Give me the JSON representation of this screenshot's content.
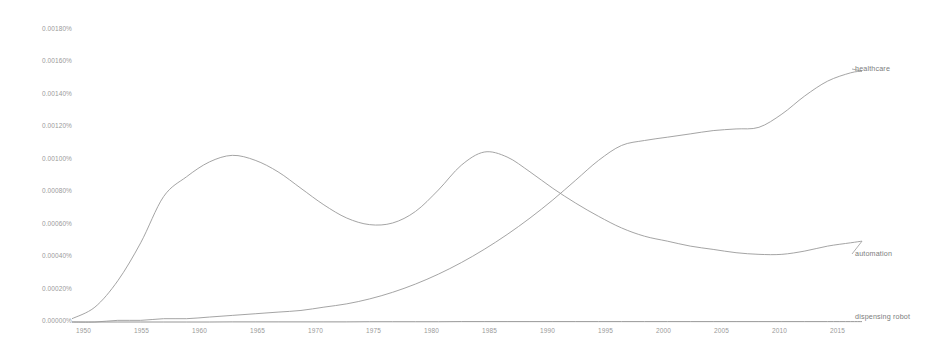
{
  "chart_data": {
    "type": "line",
    "title": "",
    "subtitle": "",
    "xlabel": "",
    "ylabel": "",
    "xlim": [
      1950,
      2019
    ],
    "ylim": [
      0.0,
      0.0018
    ],
    "grid": false,
    "legend_position": "right-inline-labels",
    "y_unit": "percent",
    "y_ticks": [
      {
        "value": 0.0018,
        "label": "0.00180%"
      },
      {
        "value": 0.0016,
        "label": "0.00160%"
      },
      {
        "value": 0.0014,
        "label": "0.00140%"
      },
      {
        "value": 0.0012,
        "label": "0.00120%"
      },
      {
        "value": 0.001,
        "label": "0.00100%"
      },
      {
        "value": 0.0008,
        "label": "0.00080%"
      },
      {
        "value": 0.0006,
        "label": "0.00060%"
      },
      {
        "value": 0.0004,
        "label": "0.00040%"
      },
      {
        "value": 0.0002,
        "label": "0.00020%"
      },
      {
        "value": 0.0,
        "label": "0.00000%"
      }
    ],
    "x_ticks": [
      {
        "value": 1950,
        "label": "1950"
      },
      {
        "value": 1955,
        "label": "1955"
      },
      {
        "value": 1960,
        "label": "1960"
      },
      {
        "value": 1965,
        "label": "1965"
      },
      {
        "value": 1970,
        "label": "1970"
      },
      {
        "value": 1975,
        "label": "1975"
      },
      {
        "value": 1980,
        "label": "1980"
      },
      {
        "value": 1985,
        "label": "1985"
      },
      {
        "value": 1990,
        "label": "1990"
      },
      {
        "value": 1995,
        "label": "1995"
      },
      {
        "value": 2000,
        "label": "2000"
      },
      {
        "value": 2005,
        "label": "2005"
      },
      {
        "value": 2010,
        "label": "2010"
      },
      {
        "value": 2015,
        "label": "2015"
      }
    ],
    "x": [
      1950,
      1952,
      1954,
      1956,
      1958,
      1960,
      1962,
      1964,
      1966,
      1968,
      1970,
      1972,
      1974,
      1976,
      1978,
      1980,
      1982,
      1984,
      1986,
      1988,
      1990,
      1992,
      1994,
      1996,
      1998,
      2000,
      2002,
      2004,
      2006,
      2008,
      2010,
      2012,
      2014,
      2016,
      2018,
      2019
    ],
    "series": [
      {
        "name": "automation",
        "color": "#9a9a9a",
        "label": "automation",
        "values": [
          2e-05,
          9e-05,
          0.00025,
          0.00048,
          0.00076,
          0.00088,
          0.00097,
          0.00101,
          0.00098,
          0.00091,
          0.00081,
          0.00071,
          0.00063,
          0.00059,
          0.0006,
          0.00067,
          0.0008,
          0.00095,
          0.00103,
          0.001,
          0.00091,
          0.00081,
          0.00072,
          0.00064,
          0.00057,
          0.00052,
          0.00049,
          0.00046,
          0.00044,
          0.00042,
          0.00041,
          0.00041,
          0.00043,
          0.00046,
          0.00048,
          0.00049
        ]
      },
      {
        "name": "healthcare",
        "color": "#9a9a9a",
        "label": "healthcare",
        "values": [
          0.0,
          0.0,
          1e-05,
          1e-05,
          2e-05,
          2e-05,
          3e-05,
          4e-05,
          5e-05,
          6e-05,
          7e-05,
          9e-05,
          0.00011,
          0.00014,
          0.00018,
          0.00023,
          0.00029,
          0.00036,
          0.00044,
          0.00053,
          0.00063,
          0.00074,
          0.00086,
          0.00098,
          0.00107,
          0.0011,
          0.00112,
          0.00114,
          0.00116,
          0.00117,
          0.00118,
          0.00126,
          0.00137,
          0.00146,
          0.00151,
          0.00152
        ]
      },
      {
        "name": "dispensing robot",
        "color": "#9a9a9a",
        "label": "dispensing robot",
        "values": [
          0.0,
          0.0,
          0.0,
          0.0,
          0.0,
          0.0,
          0.0,
          1e-06,
          1e-06,
          1e-06,
          1e-06,
          1e-06,
          1e-06,
          2e-06,
          2e-06,
          2e-06,
          2e-06,
          3e-06,
          3e-06,
          3e-06,
          3e-06,
          3e-06,
          3e-06,
          3e-06,
          3e-06,
          3e-06,
          3e-06,
          3e-06,
          3e-06,
          3e-06,
          3e-06,
          3e-06,
          3e-06,
          3e-06,
          3e-06,
          3e-06
        ]
      }
    ]
  },
  "labels": {
    "healthcare": "healthcare",
    "automation": "automation",
    "dispensing_robot": "dispensing robot"
  },
  "colors": {
    "line": "#9a9a9a",
    "axis": "#b5b5b5",
    "tick_text": "#9a9a9a",
    "background": "#ffffff"
  }
}
